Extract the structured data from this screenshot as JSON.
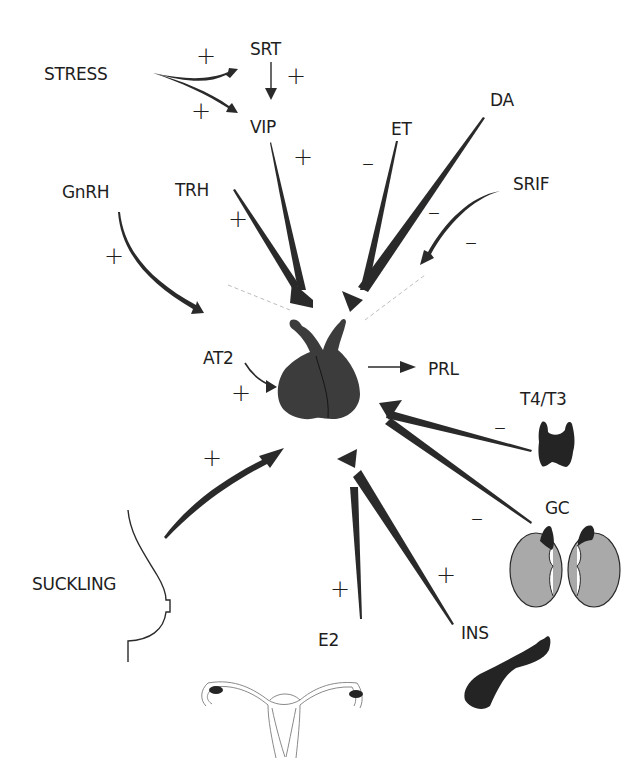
{
  "diagram": {
    "center": {
      "organ": "pituitary-gland",
      "output_label": "PRL"
    },
    "labels": {
      "stress": "STRESS",
      "srt": "SRT",
      "vip": "VIP",
      "gnrh": "GnRH",
      "trh": "TRH",
      "et": "ET",
      "da": "DA",
      "srif": "SRIF",
      "at2": "AT2",
      "prl": "PRL",
      "t4t3": "T4/T3",
      "gc": "GC",
      "suckling": "SUCKLING",
      "e2": "E2",
      "ins": "INS"
    },
    "signs": {
      "stress_srt": "+",
      "stress_vip": "+",
      "srt_vip": "+",
      "vip_pit": "+",
      "trh_pit": "+",
      "et_pit": "–",
      "da_pit": "–",
      "srif_pit_1": "–",
      "srif_pit_2": "–",
      "gnrh_at2": "+",
      "at2_pit": "+",
      "t4t3_pit": "–",
      "gc_pit": "–",
      "suckling_pit": "+",
      "e2_pit": "+",
      "ins_pit": "+"
    },
    "edges": [
      {
        "from": "STRESS",
        "to": "SRT",
        "effect": "+"
      },
      {
        "from": "STRESS",
        "to": "VIP",
        "effect": "+"
      },
      {
        "from": "SRT",
        "to": "VIP",
        "effect": "+"
      },
      {
        "from": "VIP",
        "to": "pituitary",
        "effect": "+"
      },
      {
        "from": "TRH",
        "to": "pituitary",
        "effect": "+"
      },
      {
        "from": "ET",
        "to": "pituitary",
        "effect": "-"
      },
      {
        "from": "DA",
        "to": "pituitary",
        "effect": "-"
      },
      {
        "from": "SRIF",
        "to": "pituitary",
        "effect": "-"
      },
      {
        "from": "GnRH",
        "to": "AT2",
        "effect": "+"
      },
      {
        "from": "AT2",
        "to": "pituitary",
        "effect": "+"
      },
      {
        "from": "pituitary",
        "to": "PRL",
        "effect": "output"
      },
      {
        "from": "T4/T3",
        "to": "pituitary",
        "effect": "-"
      },
      {
        "from": "GC",
        "to": "pituitary",
        "effect": "-"
      },
      {
        "from": "SUCKLING",
        "to": "pituitary",
        "effect": "+"
      },
      {
        "from": "E2",
        "to": "pituitary",
        "effect": "+"
      },
      {
        "from": "INS",
        "to": "pituitary",
        "effect": "+"
      }
    ],
    "organs": [
      "pituitary",
      "thyroid",
      "adrenal-kidneys",
      "breast",
      "uterus-ovaries",
      "pancreas"
    ]
  }
}
